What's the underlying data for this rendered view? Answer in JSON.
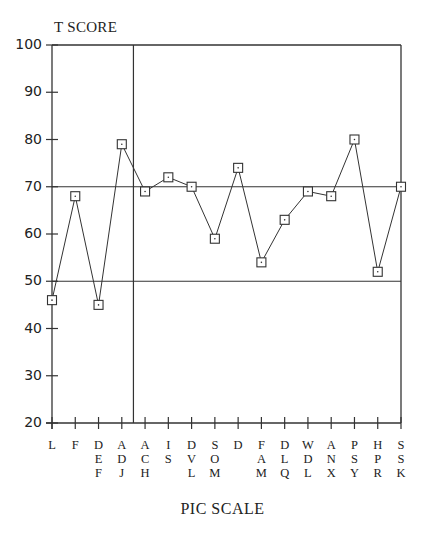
{
  "chart_data": {
    "type": "line",
    "title": "",
    "ylabel": "T SCORE",
    "xlabel": "PIC SCALE",
    "ylim": [
      20,
      100
    ],
    "yticks": [
      100,
      90,
      80,
      70,
      60,
      50,
      40,
      30,
      20
    ],
    "reference_lines": {
      "horizontal": [
        70,
        50
      ],
      "vertical_after_category_index": 3
    },
    "grid": false,
    "marker": "square",
    "categories": [
      "L",
      "F",
      "DEF",
      "ADJ",
      "ACH",
      "IS",
      "DVL",
      "SOM",
      "D",
      "FAM",
      "DLQ",
      "WDL",
      "ANX",
      "PSY",
      "HPR",
      "SSK"
    ],
    "category_labels": [
      [
        "L"
      ],
      [
        "F"
      ],
      [
        "D",
        "E",
        "F"
      ],
      [
        "A",
        "D",
        "J"
      ],
      [
        "A",
        "C",
        "H"
      ],
      [
        "I",
        "S"
      ],
      [
        "D",
        "V",
        "L"
      ],
      [
        "S",
        "O",
        "M"
      ],
      [
        "D"
      ],
      [
        "F",
        "A",
        "M"
      ],
      [
        "D",
        "L",
        "Q"
      ],
      [
        "W",
        "D",
        "L"
      ],
      [
        "A",
        "N",
        "X"
      ],
      [
        "P",
        "S",
        "Y"
      ],
      [
        "H",
        "P",
        "R"
      ],
      [
        "S",
        "S",
        "K"
      ]
    ],
    "values": [
      46,
      68,
      45,
      79,
      69,
      72,
      70,
      59,
      74,
      54,
      63,
      69,
      68,
      80,
      52,
      70
    ]
  },
  "labels": {
    "y_title": "T SCORE",
    "x_title": "PIC SCALE"
  }
}
